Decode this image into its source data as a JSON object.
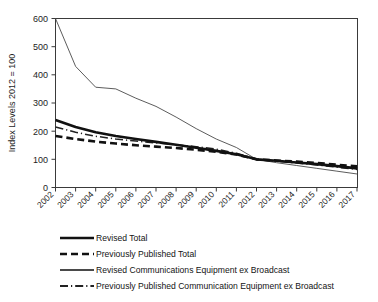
{
  "chart_data": {
    "type": "line",
    "title": "",
    "xlabel": "",
    "ylabel": "Index Levels 2012 = 100",
    "ylim": [
      0,
      600
    ],
    "yticks": [
      0,
      100,
      200,
      300,
      400,
      500,
      600
    ],
    "grid": false,
    "legend_position": "below-plot",
    "categories": [
      "2002",
      "2003",
      "2004",
      "2005",
      "2006",
      "2007",
      "2008",
      "2009",
      "2010",
      "2011",
      "2012",
      "2013",
      "2014",
      "2015",
      "2016",
      "2017"
    ],
    "x": [
      2002,
      2003,
      2004,
      2005,
      2006,
      2007,
      2008,
      2009,
      2010,
      2011,
      2012,
      2013,
      2014,
      2015,
      2016,
      2017
    ],
    "series": [
      {
        "name": "Revised Total",
        "style": "thick-solid",
        "color": "#111111",
        "values": [
          240,
          215,
          196,
          183,
          172,
          162,
          152,
          141,
          130,
          118,
          100,
          95,
          89,
          83,
          76,
          68
        ]
      },
      {
        "name": "Previously Published Total",
        "style": "thick-dashed",
        "color": "#111111",
        "values": [
          183,
          172,
          163,
          156,
          150,
          145,
          140,
          134,
          127,
          117,
          100,
          96,
          92,
          87,
          81,
          75
        ]
      },
      {
        "name": "Revised Communications Equipment ex Broadcast",
        "style": "thin-solid",
        "color": "#4a4a4a",
        "values": [
          600,
          430,
          356,
          350,
          317,
          288,
          250,
          209,
          172,
          142,
          100,
          88,
          78,
          68,
          58,
          48
        ]
      },
      {
        "name": "Previously Published Communication Equipment ex Broadcast",
        "style": "thin-dashdot",
        "color": "#222222",
        "values": [
          215,
          196,
          182,
          172,
          165,
          158,
          152,
          145,
          136,
          122,
          100,
          93,
          87,
          80,
          72,
          64
        ]
      }
    ]
  },
  "axes": {
    "y_title": "Index Levels 2012 = 100",
    "y_tick_labels": [
      "600",
      "500",
      "400",
      "300",
      "200",
      "100",
      "0"
    ],
    "x_tick_labels": [
      "2002",
      "2003",
      "2004",
      "2005",
      "2006",
      "2007",
      "2008",
      "2009",
      "2010",
      "2011",
      "2012",
      "2013",
      "2014",
      "2015",
      "2016",
      "2017"
    ]
  },
  "legend": {
    "items": [
      {
        "label": "Revised Total",
        "key": "thick-solid"
      },
      {
        "label": "Previously Published Total",
        "key": "thick-dashed"
      },
      {
        "label": "Revised Communications Equipment ex Broadcast",
        "key": "thin-solid"
      },
      {
        "label": "Previously Published Communication Equipment ex Broadcast",
        "key": "thin-dashdot"
      }
    ]
  }
}
